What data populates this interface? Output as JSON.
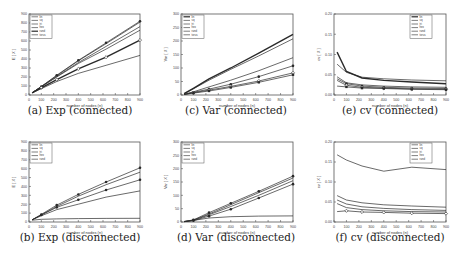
{
  "chart_data": [
    {
      "id": "a",
      "type": "line",
      "caption": "(a) Exp (connected)",
      "xlabel": "number of nodes (n)",
      "ylabel": "E [ X ]",
      "xlim": [
        0,
        900
      ],
      "ylim": [
        0,
        900
      ],
      "xticks": [
        0,
        100,
        200,
        300,
        400,
        500,
        600,
        700,
        800,
        900
      ],
      "yticks": [
        0,
        100,
        200,
        300,
        400,
        500,
        600,
        700,
        800,
        900
      ],
      "legend": {
        "position": "top-left",
        "entries": [
          "lin",
          "sq",
          "tri",
          "hex",
          "rand",
          "torus"
        ]
      },
      "x": [
        25,
        100,
        225,
        400,
        625,
        900
      ],
      "series": [
        {
          "name": "lin",
          "values": [
            25,
            95,
            215,
            380,
            570,
            810
          ],
          "marker": "none",
          "width": 1
        },
        {
          "name": "sq",
          "values": [
            25,
            92,
            205,
            360,
            540,
            760
          ],
          "marker": "none",
          "width": 1
        },
        {
          "name": "tri",
          "values": [
            25,
            95,
            220,
            385,
            580,
            820
          ],
          "marker": "dot",
          "width": 1
        },
        {
          "name": "hex",
          "values": [
            25,
            90,
            200,
            350,
            510,
            720
          ],
          "marker": "none",
          "width": 1
        },
        {
          "name": "rand",
          "values": [
            25,
            80,
            170,
            290,
            420,
            610
          ],
          "marker": "diamond",
          "width": 2
        },
        {
          "name": "torus",
          "values": [
            25,
            70,
            150,
            240,
            330,
            440
          ],
          "marker": "none",
          "width": 1
        }
      ]
    },
    {
      "id": "c",
      "type": "line",
      "caption": "(c) Var (connected)",
      "xlabel": "number of nodes (n)",
      "ylabel": "Var [ X ]",
      "xlim": [
        0,
        900
      ],
      "ylim": [
        0,
        300
      ],
      "xticks": [
        0,
        100,
        200,
        300,
        400,
        500,
        600,
        700,
        800,
        900
      ],
      "yticks": [
        0,
        50,
        100,
        150,
        200,
        250,
        300
      ],
      "legend": {
        "position": "top-left",
        "entries": [
          "lin",
          "sq",
          "tri",
          "hex",
          "rand",
          "torus"
        ]
      },
      "x": [
        25,
        100,
        225,
        400,
        625,
        900
      ],
      "series": [
        {
          "name": "lin",
          "values": [
            5,
            25,
            60,
            100,
            155,
            225
          ],
          "marker": "none",
          "width": 2
        },
        {
          "name": "sq",
          "values": [
            5,
            23,
            55,
            95,
            145,
            208
          ],
          "marker": "none",
          "width": 1
        },
        {
          "name": "tri",
          "values": [
            3,
            12,
            30,
            55,
            90,
            138
          ],
          "marker": "none",
          "width": 1
        },
        {
          "name": "hex",
          "values": [
            2,
            10,
            22,
            40,
            68,
            108
          ],
          "marker": "dot",
          "width": 1
        },
        {
          "name": "rand",
          "values": [
            2,
            8,
            18,
            32,
            52,
            82
          ],
          "marker": "diamond",
          "width": 1
        },
        {
          "name": "torus",
          "values": [
            2,
            7,
            15,
            28,
            47,
            75
          ],
          "marker": "square",
          "width": 1
        }
      ]
    },
    {
      "id": "e",
      "type": "line",
      "caption": "(e) cv (connected)",
      "xlabel": "number of nodes (n)",
      "ylabel": "cv [ X ]",
      "xlim": [
        0,
        900
      ],
      "ylim": [
        0,
        0.2
      ],
      "xticks": [
        0,
        100,
        200,
        300,
        400,
        500,
        600,
        700,
        800,
        900
      ],
      "yticks": [
        0.0,
        0.05,
        0.1,
        0.15,
        0.2
      ],
      "legend": {
        "position": "top-right",
        "entries": [
          "lin",
          "sq",
          "tri",
          "hex",
          "rand",
          "torus"
        ]
      },
      "x": [
        25,
        100,
        225,
        400,
        625,
        900
      ],
      "series": [
        {
          "name": "lin",
          "values": [
            0.106,
            0.058,
            0.042,
            0.036,
            0.032,
            0.028
          ],
          "marker": "none",
          "width": 2
        },
        {
          "name": "sq",
          "values": [
            0.076,
            0.056,
            0.044,
            0.04,
            0.037,
            0.035
          ],
          "marker": "none",
          "width": 1
        },
        {
          "name": "tri",
          "values": [
            0.045,
            0.03,
            0.025,
            0.022,
            0.02,
            0.019
          ],
          "marker": "none",
          "width": 1
        },
        {
          "name": "hex",
          "values": [
            0.04,
            0.028,
            0.022,
            0.019,
            0.017,
            0.016
          ],
          "marker": "dot",
          "width": 1
        },
        {
          "name": "rand",
          "values": [
            0.036,
            0.024,
            0.019,
            0.017,
            0.015,
            0.014
          ],
          "marker": "diamond",
          "width": 1
        },
        {
          "name": "torus",
          "values": [
            0.022,
            0.02,
            0.017,
            0.016,
            0.014,
            0.013
          ],
          "marker": "square",
          "width": 1
        }
      ]
    },
    {
      "id": "b",
      "type": "line",
      "caption": "(b) Exp (disconnected)",
      "xlabel": "number of nodes (n)",
      "ylabel": "E [ X ]",
      "xlim": [
        0,
        900
      ],
      "ylim": [
        0,
        900
      ],
      "xticks": [
        0,
        100,
        200,
        300,
        400,
        500,
        600,
        700,
        800,
        900
      ],
      "yticks": [
        0,
        100,
        200,
        300,
        400,
        500,
        600,
        700,
        800,
        900
      ],
      "legend": {
        "position": "top-left",
        "entries": [
          "lin",
          "sq",
          "tri",
          "hex",
          "rand"
        ]
      },
      "x": [
        25,
        100,
        225,
        400,
        625,
        900
      ],
      "series": [
        {
          "name": "lin",
          "values": [
            25,
            85,
            190,
            310,
            450,
            610
          ],
          "marker": "dot",
          "width": 1
        },
        {
          "name": "sq",
          "values": [
            25,
            80,
            175,
            290,
            420,
            560
          ],
          "marker": "none",
          "width": 1
        },
        {
          "name": "tri",
          "values": [
            25,
            78,
            165,
            250,
            360,
            475
          ],
          "marker": "dot",
          "width": 1
        },
        {
          "name": "hex",
          "values": [
            25,
            70,
            140,
            200,
            280,
            350
          ],
          "marker": "none",
          "width": 1
        },
        {
          "name": "rand",
          "values": [
            20,
            30,
            35,
            38,
            40,
            42
          ],
          "marker": "none",
          "width": 1
        }
      ]
    },
    {
      "id": "d",
      "type": "line",
      "caption": "(d) Var (disconnected)",
      "xlabel": "number of nodes (n)",
      "ylabel": "Var [ X ]",
      "xlim": [
        0,
        900
      ],
      "ylim": [
        0,
        300
      ],
      "xticks": [
        0,
        100,
        200,
        300,
        400,
        500,
        600,
        700,
        800,
        900
      ],
      "yticks": [
        0,
        50,
        100,
        150,
        200,
        250,
        300
      ],
      "legend": {
        "position": "top-left",
        "entries": [
          "lin",
          "sq",
          "tri",
          "hex",
          "rand"
        ]
      },
      "x": [
        25,
        100,
        225,
        400,
        625,
        900
      ],
      "series": [
        {
          "name": "lin",
          "values": [
            2,
            8,
            35,
            70,
            115,
            172
          ],
          "marker": "dot",
          "width": 1
        },
        {
          "name": "sq",
          "values": [
            2,
            7,
            30,
            65,
            110,
            165
          ],
          "marker": "none",
          "width": 1
        },
        {
          "name": "tri",
          "values": [
            2,
            6,
            27,
            58,
            100,
            155
          ],
          "marker": "none",
          "width": 1
        },
        {
          "name": "hex",
          "values": [
            1,
            5,
            22,
            48,
            90,
            142
          ],
          "marker": "dot",
          "width": 1
        },
        {
          "name": "rand",
          "values": [
            1,
            6,
            15,
            20,
            22,
            23
          ],
          "marker": "none",
          "width": 1
        }
      ]
    },
    {
      "id": "f",
      "type": "line",
      "caption": "(f) cv (disconnected)",
      "xlabel": "number of nodes (n)",
      "ylabel": "cv [ X ]",
      "xlim": [
        0,
        900
      ],
      "ylim": [
        0,
        0.2
      ],
      "xticks": [
        0,
        100,
        200,
        300,
        400,
        500,
        600,
        700,
        800,
        900
      ],
      "yticks": [
        0.0,
        0.05,
        0.1,
        0.15,
        0.2
      ],
      "legend": {
        "position": "top-right",
        "entries": [
          "lin",
          "sq",
          "tri",
          "hex",
          "rand"
        ]
      },
      "x": [
        25,
        100,
        225,
        400,
        625,
        900
      ],
      "series": [
        {
          "name": "lin",
          "values": [
            0.168,
            0.155,
            0.14,
            0.127,
            0.137,
            0.131
          ],
          "marker": "none",
          "width": 1
        },
        {
          "name": "sq",
          "values": [
            0.066,
            0.055,
            0.048,
            0.043,
            0.04,
            0.037
          ],
          "marker": "none",
          "width": 1
        },
        {
          "name": "tri",
          "values": [
            0.055,
            0.045,
            0.038,
            0.034,
            0.031,
            0.029
          ],
          "marker": "none",
          "width": 1
        },
        {
          "name": "hex",
          "values": [
            0.046,
            0.036,
            0.031,
            0.028,
            0.026,
            0.025
          ],
          "marker": "none",
          "width": 1
        },
        {
          "name": "rand",
          "values": [
            0.026,
            0.028,
            0.025,
            0.024,
            0.022,
            0.021
          ],
          "marker": "diamond",
          "width": 1
        }
      ]
    }
  ],
  "layout": {
    "panels": [
      {
        "id": "a",
        "x": 29,
        "y": 14,
        "w": 111,
        "h": 81,
        "cap_x": 80,
        "cap_y": 112
      },
      {
        "id": "c",
        "x": 181,
        "y": 14,
        "w": 112,
        "h": 81,
        "cap_x": 236,
        "cap_y": 112
      },
      {
        "id": "e",
        "x": 334,
        "y": 14,
        "w": 112,
        "h": 81,
        "cap_x": 390,
        "cap_y": 112
      },
      {
        "id": "b",
        "x": 29,
        "y": 142,
        "w": 111,
        "h": 80,
        "cap_x": 80,
        "cap_y": 239
      },
      {
        "id": "d",
        "x": 181,
        "y": 142,
        "w": 112,
        "h": 80,
        "cap_x": 236,
        "cap_y": 239
      },
      {
        "id": "f",
        "x": 334,
        "y": 142,
        "w": 112,
        "h": 80,
        "cap_x": 390,
        "cap_y": 239
      }
    ],
    "line_color": "#2a2a2a",
    "frame_color": "#555555"
  }
}
